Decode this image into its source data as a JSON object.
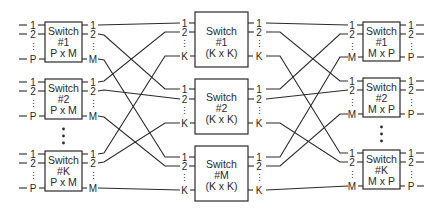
{
  "diagram": {
    "stages": {
      "ingress": {
        "switches": [
          {
            "line1": "Switch",
            "line2": "#1",
            "line3": "P x M"
          },
          {
            "line1": "Switch",
            "line2": "#2",
            "line3": "P x M"
          },
          {
            "line1": "Switch",
            "line2": "#K",
            "line3": "P x M"
          }
        ],
        "input_labels": [
          "1",
          "2",
          "P"
        ],
        "output_labels": [
          "1",
          "2",
          "M"
        ]
      },
      "middle": {
        "switches": [
          {
            "line1": "Switch",
            "line2": "#1",
            "line3": "(K x K)"
          },
          {
            "line1": "Switch",
            "line2": "#2",
            "line3": "(K x K)"
          },
          {
            "line1": "Switch",
            "line2": "#M",
            "line3": "(K x K)"
          }
        ],
        "input_labels": [
          "1",
          "2",
          "K"
        ],
        "output_labels": [
          "1",
          "2",
          "K"
        ]
      },
      "egress": {
        "switches": [
          {
            "line1": "Switch",
            "line2": "#1",
            "line3": "M x P"
          },
          {
            "line1": "Switch",
            "line2": "#2",
            "line3": "M x P"
          },
          {
            "line1": "Switch",
            "line2": "#K",
            "line3": "M x P"
          }
        ],
        "input_labels": [
          "1",
          "2",
          "M"
        ],
        "output_labels": [
          "1",
          "2",
          "P"
        ]
      }
    },
    "connections_left": [
      {
        "from": "ingress#1.1",
        "to": "middle#1.1"
      },
      {
        "from": "ingress#1.2",
        "to": "middle#2.1"
      },
      {
        "from": "ingress#1.M",
        "to": "middle#M.1"
      },
      {
        "from": "ingress#2.1",
        "to": "middle#1.2"
      },
      {
        "from": "ingress#2.2",
        "to": "middle#2.2"
      },
      {
        "from": "ingress#2.M",
        "to": "middle#M.2"
      },
      {
        "from": "ingress#K.1",
        "to": "middle#1.K"
      },
      {
        "from": "ingress#K.2",
        "to": "middle#2.K"
      },
      {
        "from": "ingress#K.M",
        "to": "middle#M.K"
      }
    ],
    "connections_right": [
      {
        "from": "middle#1.1",
        "to": "egress#1.1"
      },
      {
        "from": "middle#1.2",
        "to": "egress#2.1"
      },
      {
        "from": "middle#1.K",
        "to": "egress#K.1"
      },
      {
        "from": "middle#2.1",
        "to": "egress#1.2"
      },
      {
        "from": "middle#2.2",
        "to": "egress#2.2"
      },
      {
        "from": "middle#2.K",
        "to": "egress#K.2"
      },
      {
        "from": "middle#M.1",
        "to": "egress#1.M"
      },
      {
        "from": "middle#M.2",
        "to": "egress#2.M"
      },
      {
        "from": "middle#M.K",
        "to": "egress#K.M"
      }
    ],
    "ellipsis": "⋮",
    "colors": {
      "line": "#2a2a2a",
      "background": "#ffffff"
    }
  }
}
